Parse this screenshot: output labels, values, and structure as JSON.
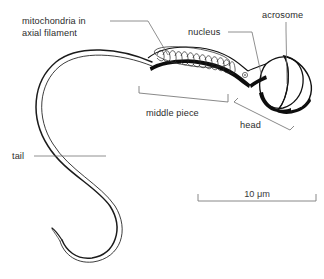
{
  "figure": {
    "type": "labeled-biological-diagram",
    "background_color": "#ffffff",
    "ink_color": "#111111",
    "leader_color": "#6b6b6b"
  },
  "labels": {
    "mitochondria_line1": "mitochondria in",
    "mitochondria_line2": "axial filament",
    "nucleus": "nucleus",
    "acrosome": "acrosome",
    "middle_piece": "middle piece",
    "head": "head",
    "tail": "tail"
  },
  "scale": {
    "value": "10",
    "unit": "μm",
    "text": "10 μm",
    "bar_length_px": 118
  },
  "parts": [
    {
      "name": "acrosome",
      "description": "cap covering anterior of head"
    },
    {
      "name": "nucleus",
      "description": "body of the head"
    },
    {
      "name": "head",
      "description": "oval anterior region"
    },
    {
      "name": "middle piece",
      "description": "region bearing mitochondrial helix"
    },
    {
      "name": "mitochondria in axial filament",
      "description": "helical coil in middle piece"
    },
    {
      "name": "tail",
      "description": "long flagellum in S-curve"
    }
  ]
}
